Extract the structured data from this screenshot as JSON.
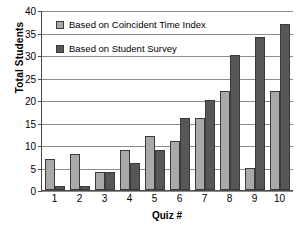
{
  "chart_data": {
    "type": "bar",
    "title": "",
    "xlabel": "Quiz #",
    "ylabel": "Total Students",
    "categories": [
      "1",
      "2",
      "3",
      "4",
      "5",
      "6",
      "7",
      "8",
      "9",
      "10"
    ],
    "series": [
      {
        "name": "Based on Coincident Time Index",
        "color": "#a9a9a9",
        "values": [
          7,
          8,
          4,
          9,
          12,
          11,
          16,
          22,
          5,
          22
        ]
      },
      {
        "name": "Based on Student Survey",
        "color": "#575757",
        "values": [
          1,
          1,
          4,
          6,
          9,
          16,
          20,
          30,
          34,
          37
        ]
      }
    ],
    "ylim": [
      0,
      40
    ],
    "yticks": [
      0,
      5,
      10,
      15,
      20,
      25,
      30,
      35,
      40
    ],
    "ytick_labels": [
      "0",
      "5",
      "10",
      "15",
      "20",
      "25",
      "30",
      "35",
      "40"
    ],
    "grid": true,
    "legend_position": "inside-top-left"
  },
  "legend": {
    "items": [
      {
        "label": "Based on Coincident Time Index",
        "swatch": "light"
      },
      {
        "label": "Based on Student Survey",
        "swatch": "dark"
      }
    ]
  }
}
